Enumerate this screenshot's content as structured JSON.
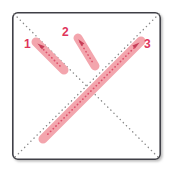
{
  "diagram": {
    "type": "stroke-order-diagram",
    "canvas": {
      "width": 173,
      "height": 172
    },
    "frame": {
      "name": "character-grid-box",
      "x": 12,
      "y": 12,
      "width": 149,
      "height": 148,
      "border_color": "#3f3f46",
      "border_width": 1.6,
      "corner_radius": 5,
      "fill": "#ffffff",
      "shadow_color": "#bdbdbd"
    },
    "guides": [
      {
        "name": "guide-diagonal-tl-br",
        "x1": 14,
        "y1": 14,
        "x2": 159,
        "y2": 158,
        "style": "dotted",
        "color": "#8a8a8a",
        "width": 1.4
      },
      {
        "name": "guide-diagonal-tr-bl",
        "x1": 159,
        "y1": 14,
        "x2": 14,
        "y2": 158,
        "style": "dotted",
        "color": "#8a8a8a",
        "width": 1.4
      }
    ],
    "stroke_color": "#f3a5ad",
    "stroke_core_color": "#d9435f",
    "label_color": "#e0355a",
    "strokes": [
      {
        "number": "1",
        "name": "stroke-1",
        "x1": 36,
        "y1": 42,
        "x2": 64,
        "y2": 70,
        "thickness": 9,
        "label": {
          "x": 24,
          "y": 38
        },
        "arrow": {
          "x": 41,
          "y": 47,
          "angle": 45
        }
      },
      {
        "number": "2",
        "name": "stroke-2",
        "x1": 78,
        "y1": 38,
        "x2": 95,
        "y2": 66,
        "thickness": 9,
        "label": {
          "x": 62,
          "y": 26
        },
        "arrow": {
          "x": 81,
          "y": 43,
          "angle": 59
        }
      },
      {
        "number": "3",
        "name": "stroke-3",
        "x1": 141,
        "y1": 41,
        "x2": 43,
        "y2": 139,
        "thickness": 9,
        "label": {
          "x": 144,
          "y": 38
        },
        "arrow": {
          "x": 135,
          "y": 47,
          "angle": 135
        }
      }
    ],
    "labels": {
      "one": "1",
      "two": "2",
      "three": "3"
    }
  }
}
